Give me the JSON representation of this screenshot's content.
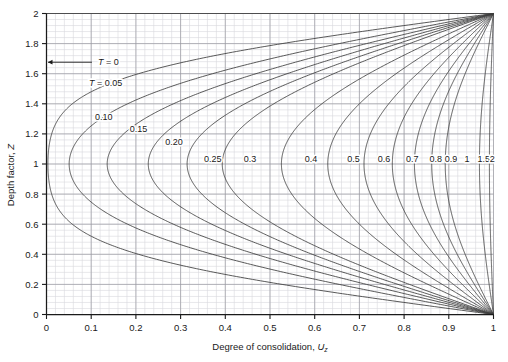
{
  "chart_data": {
    "type": "line",
    "title": "",
    "xlabel": "Degree of consolidation, U",
    "xlabel_sub": "z",
    "ylabel": "Depth factor, Z",
    "xlim": [
      0,
      1
    ],
    "ylim": [
      0,
      2
    ],
    "grid": true,
    "grid_major_step_x": 0.1,
    "grid_major_step_y": 0.2,
    "grid_minor_divisions": 5,
    "legend_position": "inline-curve-labels",
    "xticks": [
      "0",
      "0.1",
      "0.2",
      "0.3",
      "0.4",
      "0.5",
      "0.6",
      "0.7",
      "0.8",
      "0.9",
      "1"
    ],
    "xtick_values": [
      0,
      0.1,
      0.2,
      0.3,
      0.4,
      0.5,
      0.6,
      0.7,
      0.8,
      0.9,
      1
    ],
    "yticks": [
      "0",
      "0.2",
      "0.4",
      "0.6",
      "0.8",
      "1",
      "1.2",
      "1.4",
      "1.6",
      "1.8",
      "2"
    ],
    "ytick_values": [
      0,
      0.2,
      0.4,
      0.6,
      0.8,
      1.0,
      1.2,
      1.4,
      1.6,
      1.8,
      2.0
    ],
    "series_variable": "T",
    "annotations": [
      {
        "text": "T = 0",
        "value": 0,
        "arrow": true,
        "x": 0.115,
        "y": 1.655
      },
      {
        "text": "T = 0.05",
        "value": 0.05,
        "arrow": false,
        "x": 0.095,
        "y": 1.52
      }
    ],
    "series": [
      {
        "name": "T = 0",
        "T": 0,
        "label": "",
        "label_x": 0,
        "label_y": 0
      },
      {
        "name": "T = 0.05",
        "T": 0.05,
        "label": "",
        "label_x": 0,
        "label_y": 0
      },
      {
        "name": "T = 0.10",
        "T": 0.1,
        "label": "0.10",
        "label_x": 0.128,
        "label_y": 1.295
      },
      {
        "name": "T = 0.15",
        "T": 0.15,
        "label": "0.15",
        "label_x": 0.206,
        "label_y": 1.21
      },
      {
        "name": "T = 0.20",
        "T": 0.2,
        "label": "0.20",
        "label_x": 0.285,
        "label_y": 1.125
      },
      {
        "name": "T = 0.25",
        "T": 0.25,
        "label": "0.25",
        "label_x": 0.372,
        "label_y": 1.01
      },
      {
        "name": "T = 0.3",
        "T": 0.3,
        "label": "0.3",
        "label_x": 0.455,
        "label_y": 1.01
      },
      {
        "name": "T = 0.4",
        "T": 0.4,
        "label": "0.4",
        "label_x": 0.592,
        "label_y": 1.01
      },
      {
        "name": "T = 0.5",
        "T": 0.5,
        "label": "0.5",
        "label_x": 0.687,
        "label_y": 1.01
      },
      {
        "name": "T = 0.6",
        "T": 0.6,
        "label": "0.6",
        "label_x": 0.755,
        "label_y": 1.01
      },
      {
        "name": "T = 0.7",
        "T": 0.7,
        "label": "0.7",
        "label_x": 0.818,
        "label_y": 1.01
      },
      {
        "name": "T = 0.8",
        "T": 0.8,
        "label": "0.8",
        "label_x": 0.871,
        "label_y": 1.01
      },
      {
        "name": "T = 0.9",
        "T": 0.9,
        "label": "0.9",
        "label_x": 0.905,
        "label_y": 1.01
      },
      {
        "name": "T = 1",
        "T": 1.0,
        "label": "1",
        "label_x": 0.941,
        "label_y": 1.01
      },
      {
        "name": "T = 1.5",
        "T": 1.5,
        "label": "1.5",
        "label_x": 0.978,
        "label_y": 1.01
      },
      {
        "name": "T = 2",
        "T": 2.0,
        "label": "2",
        "label_x": 0.997,
        "label_y": 1.01
      }
    ],
    "colors": {
      "curve": "#3c3c3c",
      "axis": "#1a1a1a",
      "grid_major": "#9a9aa0",
      "grid_minor": "#d8d8dd",
      "background": "#ffffff",
      "text": "#1a1a1a"
    }
  }
}
